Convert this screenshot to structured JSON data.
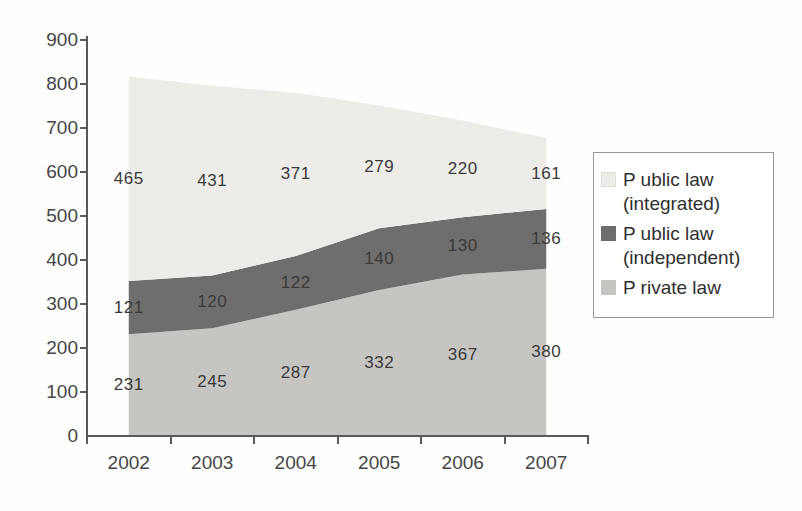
{
  "chart_data": {
    "type": "area",
    "stacked": true,
    "title": "",
    "xlabel": "",
    "ylabel": "",
    "x_labels": [
      "2002",
      "2003",
      "2004",
      "2005",
      "2006",
      "2007"
    ],
    "series": [
      {
        "name": "Private law",
        "values": [
          231,
          245,
          287,
          332,
          367,
          380
        ],
        "color": "#c6c5c2"
      },
      {
        "name": "Public law (independent)",
        "values": [
          121,
          120,
          122,
          140,
          130,
          136
        ],
        "color": "#6f6e6c"
      },
      {
        "name": "Public law (integrated)",
        "values": [
          465,
          431,
          371,
          279,
          220,
          161
        ],
        "color": "#edece8"
      }
    ],
    "ylim": [
      0,
      900
    ],
    "ytick_step": 100,
    "grid": false,
    "legend_position": "right",
    "data_labels": true,
    "axis_color": "#59595b",
    "label_color": "#3a3a3a"
  },
  "legend": {
    "items": [
      {
        "lines": [
          "P ublic law",
          "(integrated)"
        ],
        "series_index": 2
      },
      {
        "lines": [
          "P ublic law",
          "(independent)"
        ],
        "series_index": 1
      },
      {
        "lines": [
          "P rivate law"
        ],
        "series_index": 0
      }
    ]
  }
}
